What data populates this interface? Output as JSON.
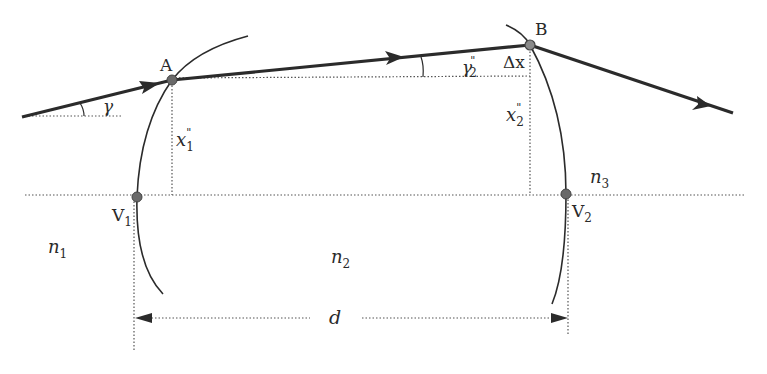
{
  "diagram": {
    "type": "thick lens ray trace",
    "points": {
      "A": {
        "label": "A",
        "x": 172,
        "y": 80
      },
      "B": {
        "label": "B",
        "x": 530,
        "y": 45
      },
      "V1": {
        "label": "V",
        "sub": "1",
        "x": 137,
        "y": 197
      },
      "V2": {
        "label": "V",
        "sub": "2",
        "x": 566,
        "y": 194
      }
    },
    "labels": {
      "gamma": "γ",
      "gamma2_main": "γ",
      "gamma2_sup": "\"",
      "gamma2_sub": "2",
      "delta_x": "Δx",
      "x1_main": "x",
      "x1_sup": "\"",
      "x1_sub": "1",
      "x2_main": "x",
      "x2_sup": "\"",
      "x2_sub": "2",
      "n1_main": "n",
      "n1_sub": "1",
      "n2_main": "n",
      "n2_sub": "2",
      "n3_main": "n",
      "n3_sub": "3",
      "d": "d"
    },
    "colors": {
      "ray": "#2b2b2b",
      "surface": "#2b2b2b",
      "dotted": "#555555",
      "point": "#6a6a6a"
    }
  }
}
